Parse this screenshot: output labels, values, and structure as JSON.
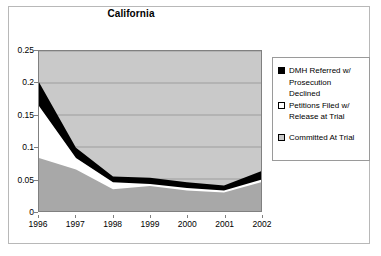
{
  "chart_data": {
    "type": "area",
    "stacked": true,
    "title": "California",
    "xlabel": "",
    "ylabel": "",
    "categories": [
      "1996",
      "1997",
      "1998",
      "1999",
      "2000",
      "2001",
      "2002"
    ],
    "x": [
      1996,
      1997,
      1998,
      1999,
      2000,
      2001,
      2002
    ],
    "ylim": [
      0,
      0.25
    ],
    "yticks": [
      "0",
      "0.05",
      "0.1",
      "0.15",
      "0.2",
      "0.25"
    ],
    "ytick_values": [
      0,
      0.05,
      0.1,
      0.15,
      0.2,
      0.25
    ],
    "grid": true,
    "grid_axis": "y",
    "legend_position": "right",
    "series": [
      {
        "name": "Committed At Trial",
        "color": "#c9c9c9",
        "order": 1,
        "values": [
          0.083,
          0.065,
          0.034,
          0.039,
          0.032,
          0.029,
          0.045
        ]
      },
      {
        "name": "Petitions Filed w/ Release at Trial",
        "color": "#ffffff",
        "order": 2,
        "values": [
          0.081,
          0.018,
          0.011,
          0.003,
          0.004,
          0.003,
          0.004
        ]
      },
      {
        "name": "DMH Referred w/ Prosecution Declined",
        "color": "#000000",
        "order": 3,
        "values": [
          0.037,
          0.016,
          0.009,
          0.01,
          0.009,
          0.008,
          0.013
        ]
      }
    ],
    "cumulative_tops": {
      "committed_at_trial": [
        0.083,
        0.065,
        0.034,
        0.039,
        0.032,
        0.029,
        0.045
      ],
      "plus_petitions_filed": [
        0.164,
        0.083,
        0.045,
        0.042,
        0.036,
        0.032,
        0.049
      ],
      "plus_dmh_referred": [
        0.201,
        0.099,
        0.054,
        0.052,
        0.045,
        0.04,
        0.062
      ]
    }
  },
  "legend": {
    "items": [
      {
        "label_line1": "DMH Referred w/",
        "label_line2": "Prosecution",
        "label_line3": "Declined",
        "swatch": "black"
      },
      {
        "label_line1": "Petitions Filed w/",
        "label_line2": "Release at Trial",
        "swatch": "white"
      },
      {
        "label_line1": "Committed At Trial",
        "swatch": "gray"
      }
    ]
  },
  "colors": {
    "series_black": "#000000",
    "series_white": "#ffffff",
    "series_gray": "#c9c9c9",
    "plot_border": "#808080",
    "frame_border": "#b8b8b8",
    "gridline": "#808080"
  }
}
